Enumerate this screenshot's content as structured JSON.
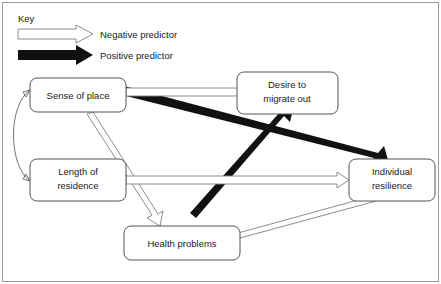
{
  "figure": {
    "type": "path-diagram",
    "frame_color": "#9a9a9a",
    "background": "#ffffff"
  },
  "legend": {
    "title": "Key",
    "items": [
      {
        "label": "Negative predictor",
        "style": "hollow-block-arrow",
        "fill": "#ffffff",
        "stroke": "#808080",
        "icon": "arrow-right-outline-icon"
      },
      {
        "label": "Positive predictor",
        "style": "solid-block-arrow",
        "fill": "#111111",
        "stroke": "#111111",
        "icon": "arrow-right-solid-icon"
      }
    ]
  },
  "nodes": [
    {
      "id": "sense_of_place",
      "label": "Sense of place",
      "lines": [
        "Sense of place"
      ]
    },
    {
      "id": "desire_to_migrate_out",
      "label": "Desire to migrate out",
      "lines": [
        "Desire to",
        "migrate out"
      ]
    },
    {
      "id": "length_of_residence",
      "label": "Length of residence",
      "lines": [
        "Length of",
        "residence"
      ]
    },
    {
      "id": "individual_resilience",
      "label": "Individual resilience",
      "lines": [
        "Individual",
        "resilience"
      ]
    },
    {
      "id": "health_problems",
      "label": "Health problems",
      "lines": [
        "Health problems"
      ]
    }
  ],
  "edges": [
    {
      "id": "sop-to-desire",
      "from": "sense_of_place",
      "to": "desire_to_migrate_out",
      "type": "negative",
      "style": "hollow-block-arrow"
    },
    {
      "id": "sop-to-resilience",
      "from": "sense_of_place",
      "to": "individual_resilience",
      "type": "positive",
      "style": "solid-block-arrow"
    },
    {
      "id": "sop-to-health",
      "from": "sense_of_place",
      "to": "health_problems",
      "type": "negative",
      "style": "hollow-block-arrow"
    },
    {
      "id": "health-to-desire",
      "from": "health_problems",
      "to": "desire_to_migrate_out",
      "type": "positive",
      "style": "solid-block-arrow"
    },
    {
      "id": "health-to-resilience",
      "from": "health_problems",
      "to": "individual_resilience",
      "type": "negative",
      "style": "hollow-block-arrow"
    },
    {
      "id": "residence-to-resilience",
      "from": "length_of_residence",
      "to": "individual_resilience",
      "type": "negative",
      "style": "hollow-block-arrow"
    },
    {
      "id": "sop-residence-correlation",
      "from": "sense_of_place",
      "to": "length_of_residence",
      "type": "correlation",
      "style": "double-headed-curve"
    }
  ]
}
